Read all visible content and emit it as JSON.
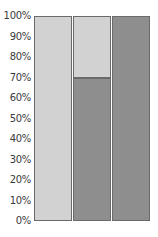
{
  "chart_data": {
    "type": "bar",
    "stacked": true,
    "percent": true,
    "title": "",
    "xlabel": "",
    "ylabel": "",
    "categories": [
      "",
      "",
      ""
    ],
    "series": [
      {
        "name": "dark",
        "color": "#8e8e8e",
        "values": [
          0,
          70,
          100
        ]
      },
      {
        "name": "light",
        "color": "#d2d2d2",
        "values": [
          100,
          30,
          0
        ]
      }
    ],
    "ylim": [
      0,
      100
    ],
    "yticks": [
      "0%",
      "10%",
      "20%",
      "30%",
      "40%",
      "50%",
      "60%",
      "70%",
      "80%",
      "90%",
      "100%"
    ],
    "grid": false,
    "legend": null
  }
}
